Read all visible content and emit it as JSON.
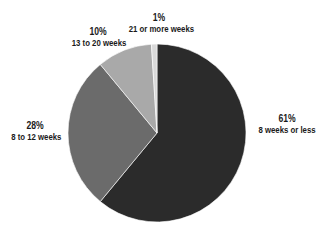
{
  "chart_data": {
    "type": "pie",
    "title": "",
    "start_angle_deg": 0,
    "direction": "clockwise",
    "slices": [
      {
        "label": "8 weeks or less",
        "value": 61,
        "pct_label": "61%",
        "color": "#2b2b2b"
      },
      {
        "label": "8 to 12 weeks",
        "value": 28,
        "pct_label": "28%",
        "color": "#6b6b6b"
      },
      {
        "label": "13 to 20 weeks",
        "value": 10,
        "pct_label": "10%",
        "color": "#a9a9a9"
      },
      {
        "label": "21 or more weeks",
        "value": 1,
        "pct_label": "1%",
        "color": "#d9d9d9"
      }
    ],
    "legend": "none (direct labels)"
  },
  "labels": {
    "s0": {
      "pct": "61%",
      "cat": "8 weeks or less"
    },
    "s1": {
      "pct": "28%",
      "cat": "8 to 12 weeks"
    },
    "s2": {
      "pct": "10%",
      "cat": "13 to 20 weeks"
    },
    "s3": {
      "pct": "1%",
      "cat": "21 or more weeks"
    }
  }
}
